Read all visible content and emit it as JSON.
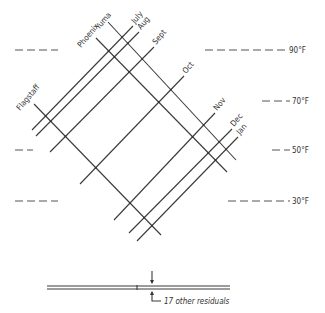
{
  "diagram": {
    "site_lines": [
      {
        "label": "Flagstaff",
        "x1": 34,
        "y1": 104,
        "x2": 161,
        "y2": 235,
        "lx": 20,
        "ly": 111
      },
      {
        "label": "Phoenix",
        "x1": 96,
        "y1": 38,
        "x2": 227,
        "y2": 172,
        "lx": 81,
        "ly": 48
      },
      {
        "label": "Yuma",
        "x1": 108,
        "y1": 22,
        "x2": 236,
        "y2": 160,
        "lx": 99,
        "ly": 30
      }
    ],
    "month_lines": [
      {
        "label": "July",
        "x1": 32,
        "y1": 130,
        "x2": 133,
        "y2": 26,
        "lx": 135,
        "ly": 24
      },
      {
        "label": "Aug",
        "x1": 36,
        "y1": 136,
        "x2": 139,
        "y2": 32,
        "lx": 141,
        "ly": 30
      },
      {
        "label": "Sept",
        "x1": 50,
        "y1": 152,
        "x2": 154,
        "y2": 47,
        "lx": 156,
        "ly": 45
      },
      {
        "label": "Oct",
        "x1": 80,
        "y1": 184,
        "x2": 184,
        "y2": 76,
        "lx": 186,
        "ly": 74
      },
      {
        "label": "Nov",
        "x1": 114,
        "y1": 220,
        "x2": 215,
        "y2": 113,
        "lx": 217,
        "ly": 111
      },
      {
        "label": "Dec",
        "x1": 129,
        "y1": 233,
        "x2": 232,
        "y2": 129,
        "lx": 234,
        "ly": 127
      },
      {
        "label": "Jan",
        "x1": 137,
        "y1": 241,
        "x2": 238,
        "y2": 137,
        "lx": 240,
        "ly": 135
      }
    ],
    "temperature_levels": [
      {
        "label": "90°F",
        "y": 50,
        "left": [
          15,
          58
        ],
        "right": [
          205,
          287
        ]
      },
      {
        "label": "70°F",
        "y": 101,
        "left": null,
        "right": [
          262,
          290
        ]
      },
      {
        "label": "50°F",
        "y": 150,
        "left": [
          15,
          33
        ],
        "right": [
          272,
          290
        ]
      },
      {
        "label": "30°F",
        "y": 201,
        "left": [
          15,
          58
        ],
        "right": [
          228,
          290
        ]
      }
    ],
    "residuals": {
      "label": "17 other residuals",
      "bar_x1": 47,
      "bar_x2": 230,
      "tick_x": 137,
      "arrow_x": 152
    }
  }
}
